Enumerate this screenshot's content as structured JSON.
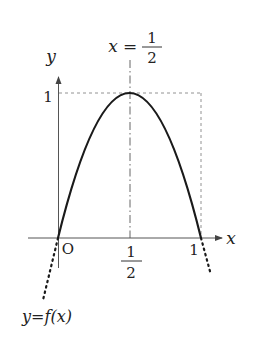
{
  "diagram": {
    "type": "function-graph",
    "axes": {
      "x_label": "x",
      "y_label": "y",
      "origin_label": "O"
    },
    "ticks": {
      "x_half_num": "1",
      "x_half_den": "2",
      "x_one": "1",
      "y_one": "1"
    },
    "symmetry_line": {
      "lhs": "x",
      "eq": "=",
      "num": "1",
      "den": "2"
    },
    "curve_label": "y=f(x)",
    "key_points": [
      {
        "x": 0,
        "y": 0
      },
      {
        "x": 0.5,
        "y": 1
      },
      {
        "x": 1,
        "y": 0
      }
    ],
    "colors": {
      "curve": "#1a1a1a",
      "axis": "#555555",
      "guide": "#666666"
    }
  }
}
